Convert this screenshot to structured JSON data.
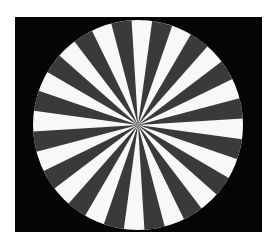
{
  "image": {
    "title": "Radial starburst test pattern",
    "description": "A circular pinwheel of alternating dark and light wedges on a black square field, centered on a white page background.",
    "width": 272,
    "height": 247,
    "background_color": "#ffffff"
  },
  "figure": {
    "type": "radial-sector-pattern",
    "panel": {
      "name": "black-square-field",
      "x": 15,
      "y": 17,
      "width": 247,
      "height": 215,
      "color": "#050505"
    },
    "disc": {
      "name": "starburst-disc",
      "center_x": 138,
      "center_y": 125,
      "radius": 105,
      "sector_count": 32,
      "sector_angle_deg": 11.25,
      "rotation_offset_deg": -3.5,
      "dark_sector_count": 16,
      "light_sector_count": 16,
      "dark_color": "#3a3a3a",
      "light_color": "#f8f8f8"
    },
    "hub": {
      "name": "center-hub",
      "radius": 3,
      "color": "#8c8c8c"
    }
  },
  "chart_data": {
    "type": "pie",
    "categories": [
      "sector-01",
      "sector-02",
      "sector-03",
      "sector-04",
      "sector-05",
      "sector-06",
      "sector-07",
      "sector-08",
      "sector-09",
      "sector-10",
      "sector-11",
      "sector-12",
      "sector-13",
      "sector-14",
      "sector-15",
      "sector-16",
      "sector-17",
      "sector-18",
      "sector-19",
      "sector-20",
      "sector-21",
      "sector-22",
      "sector-23",
      "sector-24",
      "sector-25",
      "sector-26",
      "sector-27",
      "sector-28",
      "sector-29",
      "sector-30",
      "sector-31",
      "sector-32"
    ],
    "values": [
      11.25,
      11.25,
      11.25,
      11.25,
      11.25,
      11.25,
      11.25,
      11.25,
      11.25,
      11.25,
      11.25,
      11.25,
      11.25,
      11.25,
      11.25,
      11.25,
      11.25,
      11.25,
      11.25,
      11.25,
      11.25,
      11.25,
      11.25,
      11.25,
      11.25,
      11.25,
      11.25,
      11.25,
      11.25,
      11.25,
      11.25,
      11.25
    ],
    "colors": [
      "#f8f8f8",
      "#3a3a3a",
      "#f8f8f8",
      "#3a3a3a",
      "#f8f8f8",
      "#3a3a3a",
      "#f8f8f8",
      "#3a3a3a",
      "#f8f8f8",
      "#3a3a3a",
      "#f8f8f8",
      "#3a3a3a",
      "#f8f8f8",
      "#3a3a3a",
      "#f8f8f8",
      "#3a3a3a",
      "#f8f8f8",
      "#3a3a3a",
      "#f8f8f8",
      "#3a3a3a",
      "#f8f8f8",
      "#3a3a3a",
      "#f8f8f8",
      "#3a3a3a",
      "#f8f8f8",
      "#3a3a3a",
      "#f8f8f8",
      "#3a3a3a",
      "#f8f8f8",
      "#3a3a3a",
      "#f8f8f8",
      "#3a3a3a"
    ],
    "xlabel": "",
    "ylabel": "",
    "legend": false,
    "grid": false,
    "units": "degrees"
  }
}
